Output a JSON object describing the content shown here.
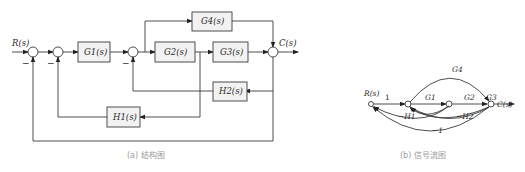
{
  "block_diagram": {
    "caption": "(a) 结构图",
    "input_label": "R(s)",
    "output_label": "C(s)",
    "blocks": {
      "G1": "G1(s)",
      "G2": "G2(s)",
      "G3": "G3(s)",
      "G4": "G4(s)",
      "H1": "H1(s)",
      "H2": "H2(s)"
    },
    "signs": {
      "minus": "−"
    }
  },
  "signal_flow_graph": {
    "caption": "(b) 信号流图",
    "input_label": "R(s)",
    "output_label": "C(s)",
    "branch_gains": {
      "input": "1",
      "G1": "G1",
      "G2": "G2",
      "G3": "G3",
      "G4": "G4",
      "minus_H1": "−H1",
      "minus_H2": "−H2",
      "minus_one": "−1"
    }
  },
  "colors": {
    "line": "#3a3a3a",
    "block_fill": "#f2f2f2",
    "caption": "#9a9a9a"
  }
}
